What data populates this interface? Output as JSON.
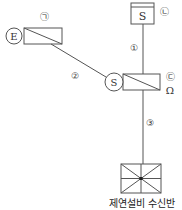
{
  "diagram": {
    "top_device": {
      "letter": "S",
      "label": "㉡"
    },
    "left_device": {
      "circle_letter": "E",
      "label": "㉠"
    },
    "center_device": {
      "circle_letter": "S",
      "label": "㉢",
      "symbol": "Ω"
    },
    "wires": [
      {
        "id": "wire-1",
        "label": "①"
      },
      {
        "id": "wire-2",
        "label": "②"
      },
      {
        "id": "wire-3",
        "label": "③"
      }
    ],
    "bottom_device": {
      "caption": "제연설비 수신반"
    }
  },
  "colors": {
    "line": "#555555",
    "background": "#ffffff"
  }
}
